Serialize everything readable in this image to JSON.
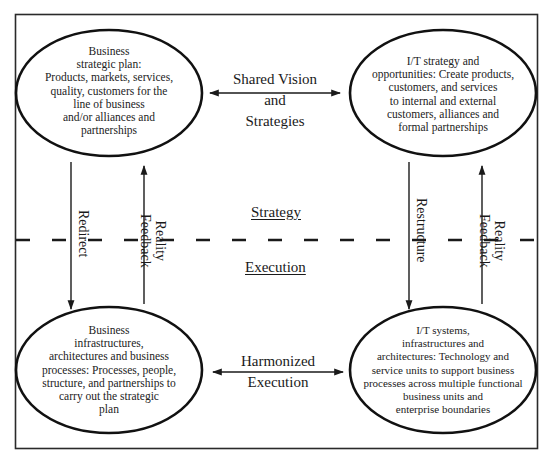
{
  "diagram": {
    "type": "strategic alignment model",
    "colors": {
      "line": "#1a1a1a",
      "background": "#ffffff",
      "frame": "#2a2a2a"
    },
    "sections": {
      "top": "Strategy",
      "bottom": "Execution"
    },
    "nodes": {
      "business_strategy": {
        "lines": [
          "Business",
          "strategic plan:",
          "Products, markets, services,",
          "quality, customers for the",
          "line of business",
          "and/or alliances and",
          "partnerships"
        ]
      },
      "it_strategy": {
        "lines": [
          "I/T strategy and",
          "opportunities: Create products,",
          "customers, and services",
          "to internal and external",
          "customers, alliances and",
          "formal partnerships"
        ]
      },
      "business_infrastructure": {
        "lines": [
          "Business",
          "infrastructures,",
          "architectures and business",
          "processes: Processes, people,",
          "structure, and partnerships to",
          "carry out the strategic",
          "plan"
        ]
      },
      "it_infrastructure": {
        "lines": [
          "I/T systems,",
          "infrastructures and",
          "architectures: Technology and",
          "service units to support business",
          "processes across multiple functional",
          "business units and",
          "enterprise boundaries"
        ]
      }
    },
    "connectors": {
      "shared_vision": {
        "lines": [
          "Shared Vision",
          "and",
          "Strategies"
        ],
        "direction": "bidirectional"
      },
      "harmonized_execution": {
        "lines": [
          "Harmonized",
          "Execution"
        ],
        "direction": "bidirectional"
      },
      "redirect": {
        "label": "Redirect",
        "direction": "down"
      },
      "left_reality_feedback": {
        "lines": [
          "Reality",
          "Feedback"
        ],
        "direction": "up"
      },
      "restructure": {
        "label": "Restructure",
        "direction": "down"
      },
      "right_reality_feedback": {
        "lines": [
          "Reality",
          "Feedback"
        ],
        "direction": "up"
      }
    }
  }
}
